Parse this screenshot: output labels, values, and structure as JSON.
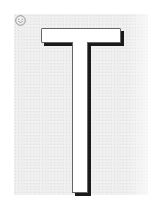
{
  "canvas": {
    "width": 157,
    "height": 201,
    "background_color": "#ffffff",
    "backdrop_color": "#eeeeee"
  },
  "icon": {
    "name": "smiley-icon",
    "stroke_color": "#8a8a8a"
  },
  "glyph": {
    "letter": "T",
    "fill_color": "#ffffff",
    "outline_color": "#666666",
    "shadow_color": "#1a1a1a"
  }
}
